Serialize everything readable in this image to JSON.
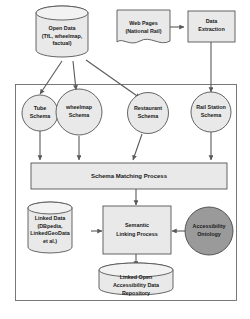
{
  "diagram": {
    "colors": {
      "node_fill_light": "#e9e9e9",
      "node_fill_dark": "#9a9a9a",
      "stroke": "#555555",
      "container_stroke": "#6b6b6b",
      "arrow": "#5a5a5a",
      "text": "#1a1a1a",
      "background": "#ffffff"
    },
    "nodes": {
      "open_data": {
        "shape": "cylinder",
        "lines": [
          "Open Data",
          "(TfL, wheelmap,",
          "factual)"
        ]
      },
      "web_pages": {
        "shape": "document",
        "lines": [
          "Web Pages",
          "(National Rail)"
        ]
      },
      "data_extraction": {
        "shape": "rectangle",
        "lines": [
          "Data",
          "Extraction"
        ]
      },
      "tube_schema": {
        "shape": "circle",
        "lines": [
          "Tube",
          "Schema"
        ]
      },
      "wheelmap_schema": {
        "shape": "circle",
        "lines": [
          "wheelmap",
          "Schema"
        ]
      },
      "restaurant_schema": {
        "shape": "circle",
        "lines": [
          "Restaurant",
          "Schema"
        ]
      },
      "railstation_schema": {
        "shape": "circle",
        "lines": [
          "Rail Station",
          "Schema"
        ]
      },
      "schema_matching": {
        "shape": "rectangle",
        "lines": [
          "Schema Matching Process"
        ]
      },
      "linked_data": {
        "shape": "cylinder",
        "lines": [
          "Linked Data",
          "(DBpedia,",
          "LinkedGeoData",
          "et al.)"
        ]
      },
      "semantic_linking": {
        "shape": "rectangle",
        "lines": [
          "Semantic",
          "Linking Process"
        ]
      },
      "accessibility_ontology": {
        "shape": "circle-dark",
        "lines": [
          "Accessibility",
          "Ontology"
        ]
      },
      "loa_repository": {
        "shape": "cylinder",
        "lines": [
          "Linked Open",
          "Accessibility Data",
          "Repository"
        ]
      }
    },
    "edges": [
      {
        "from": "web_pages",
        "to": "data_extraction"
      },
      {
        "from": "open_data",
        "to": "tube_schema"
      },
      {
        "from": "open_data",
        "to": "wheelmap_schema"
      },
      {
        "from": "open_data",
        "to": "restaurant_schema"
      },
      {
        "from": "data_extraction",
        "to": "railstation_schema"
      },
      {
        "from": "tube_schema",
        "to": "schema_matching"
      },
      {
        "from": "wheelmap_schema",
        "to": "schema_matching"
      },
      {
        "from": "restaurant_schema",
        "to": "schema_matching"
      },
      {
        "from": "railstation_schema",
        "to": "schema_matching"
      },
      {
        "from": "schema_matching",
        "to": "semantic_linking"
      },
      {
        "from": "linked_data",
        "to": "semantic_linking"
      },
      {
        "from": "accessibility_ontology",
        "to": "semantic_linking"
      },
      {
        "from": "semantic_linking",
        "to": "loa_repository"
      }
    ]
  }
}
